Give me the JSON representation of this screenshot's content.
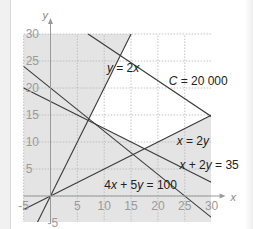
{
  "chart_data": {
    "type": "line",
    "title": "",
    "xlabel": "x",
    "ylabel": "y",
    "xlim": [
      -5,
      30
    ],
    "ylim": [
      -5,
      30
    ],
    "grid": true,
    "x_ticks": [
      "-5",
      "5",
      "10",
      "15",
      "20",
      "25",
      "30"
    ],
    "y_ticks": [
      "30",
      "25",
      "20",
      "15",
      "10",
      "5",
      "-5"
    ],
    "origin_label": "0",
    "series": [
      {
        "name": "y = 2x",
        "points": [
          [
            -2.5,
            -5
          ],
          [
            15,
            30
          ]
        ]
      },
      {
        "name": "C = 20000",
        "points": [
          [
            7,
            30
          ],
          [
            30,
            14.7
          ]
        ]
      },
      {
        "name": "x = 2y",
        "points": [
          [
            -5,
            -2.5
          ],
          [
            30,
            15
          ]
        ]
      },
      {
        "name": "x + 2y = 35",
        "points": [
          [
            -5,
            20
          ],
          [
            30,
            2.5
          ]
        ]
      },
      {
        "name": "4x + 5y = 100",
        "points": [
          [
            -5,
            24
          ],
          [
            30,
            -4
          ]
        ]
      }
    ],
    "annotations": [
      {
        "text": "y = 2x",
        "x": 10.5,
        "y": 23
      },
      {
        "text": "C = 20 000",
        "x": 22,
        "y": 20.5
      },
      {
        "text": "x = 2y",
        "x": 23.5,
        "y": 9.5
      },
      {
        "text": "x + 2y = 35",
        "x": 24,
        "y": 5
      },
      {
        "text": "4x + 5y = 100",
        "x": 10,
        "y": 1.3
      }
    ],
    "shaded_region": "infeasible areas shaded grey; feasible region (white) bounded by y=2x, x=2y, x+2y=35"
  },
  "colors": {
    "shade": "#e4e4e4",
    "line": "#3a3a3a",
    "grid": "#b5b5b5",
    "tick": "#9a9a9a"
  }
}
